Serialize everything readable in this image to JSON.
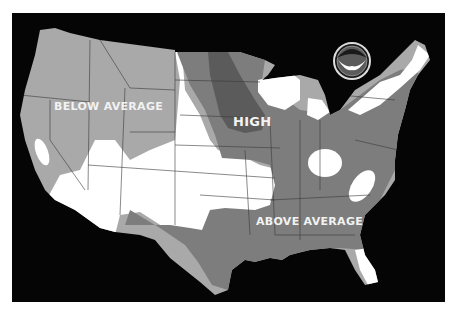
{
  "map": {
    "title": "",
    "region": "Contiguous United States",
    "labels": {
      "below": "BELOW AVERAGE",
      "high": "HIGH",
      "above": "ABOVE AVERAGE"
    },
    "logo": {
      "name": "NOAA",
      "text": "NOAA"
    },
    "legend_categories": [
      {
        "name": "BELOW AVERAGE",
        "color": "#a9a9a9"
      },
      {
        "name": "AVERAGE",
        "color": "#ffffff"
      },
      {
        "name": "ABOVE AVERAGE",
        "color": "#7d7d7d"
      },
      {
        "name": "HIGH",
        "color": "#5b5b5b"
      }
    ],
    "colors": {
      "background": "#050505",
      "below": "#a9a9a9",
      "average": "#ffffff",
      "above": "#7d7d7d",
      "high": "#5b5b5b",
      "border": "#3a3a3a"
    }
  }
}
